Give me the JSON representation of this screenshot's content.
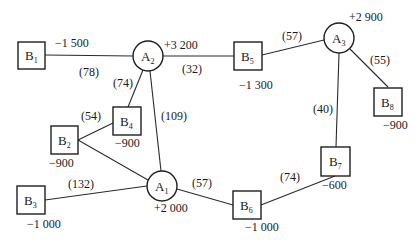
{
  "diagram": {
    "type": "transportation-network",
    "colors": {
      "stroke": "#1e1e1e",
      "background": "#ffffff",
      "text": "#1a1a1a"
    },
    "nodes": [
      {
        "id": "A1",
        "letter": "A",
        "sub": "1",
        "shape": "circle",
        "value": "+2 000"
      },
      {
        "id": "A2",
        "letter": "A",
        "sub": "2",
        "shape": "circle",
        "value": "+3 200"
      },
      {
        "id": "A3",
        "letter": "A",
        "sub": "3",
        "shape": "circle",
        "value": "+2 900"
      },
      {
        "id": "B1",
        "letter": "B",
        "sub": "1",
        "shape": "box",
        "value": "−1 500"
      },
      {
        "id": "B2",
        "letter": "B",
        "sub": "2",
        "shape": "box",
        "value": "−900"
      },
      {
        "id": "B3",
        "letter": "B",
        "sub": "3",
        "shape": "box",
        "value": "−1 000"
      },
      {
        "id": "B4",
        "letter": "B",
        "sub": "4",
        "shape": "box",
        "value": "−900"
      },
      {
        "id": "B5",
        "letter": "B",
        "sub": "5",
        "shape": "box",
        "value": "−1 300"
      },
      {
        "id": "B6",
        "letter": "B",
        "sub": "6",
        "shape": "box",
        "value": "−1 000"
      },
      {
        "id": "B7",
        "letter": "B",
        "sub": "7",
        "shape": "box",
        "value": "−600"
      },
      {
        "id": "B8",
        "letter": "B",
        "sub": "8",
        "shape": "box",
        "value": "−900"
      }
    ],
    "edges": [
      {
        "from": "B1",
        "to": "A2",
        "label": "(78)"
      },
      {
        "from": "A2",
        "to": "B5",
        "label": "(32)"
      },
      {
        "from": "A2",
        "to": "B4",
        "label": "(74)"
      },
      {
        "from": "A2",
        "to": "A1",
        "label": "(109)"
      },
      {
        "from": "B5",
        "to": "A3",
        "label": "(57)"
      },
      {
        "from": "A3",
        "to": "B8",
        "label": "(55)"
      },
      {
        "from": "A3",
        "to": "B7",
        "label": "(40)"
      },
      {
        "from": "B2",
        "to": "B4",
        "label": "(54)"
      },
      {
        "from": "B2",
        "to": "A1",
        "label": ""
      },
      {
        "from": "B3",
        "to": "A1",
        "label": "(132)"
      },
      {
        "from": "A1",
        "to": "B6",
        "label": "(57)"
      },
      {
        "from": "B6",
        "to": "B7",
        "label": "(74)"
      }
    ]
  }
}
